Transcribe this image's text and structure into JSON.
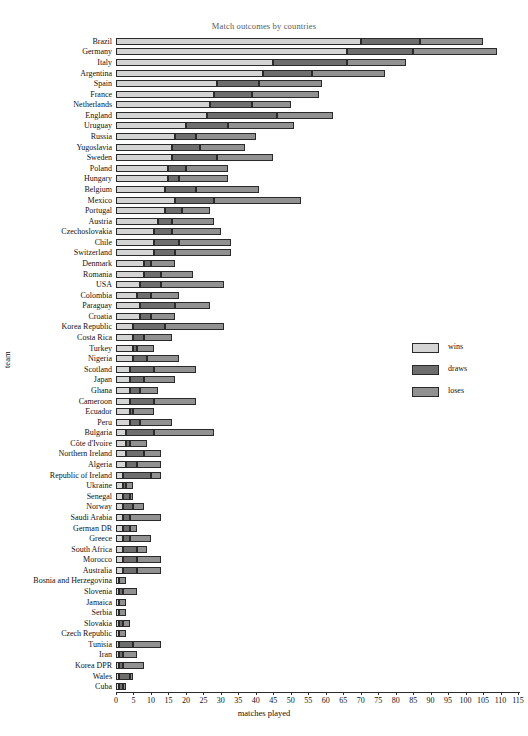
{
  "chart_data": {
    "type": "bar",
    "orientation": "horizontal",
    "stacked": true,
    "title": "Match outcomes by countries",
    "xlabel": "matches played",
    "ylabel": "team",
    "xlim": [
      0,
      115
    ],
    "xticks": [
      0,
      5,
      10,
      15,
      20,
      25,
      30,
      35,
      40,
      45,
      50,
      55,
      60,
      65,
      70,
      75,
      80,
      85,
      90,
      95,
      100,
      105,
      110,
      115
    ],
    "grid": false,
    "legend": {
      "position": "right",
      "entries": [
        {
          "name": "wins",
          "color": "#d4d4d4"
        },
        {
          "name": "draws",
          "color": "#6e6e6e"
        },
        {
          "name": "loses",
          "color": "#919191"
        }
      ]
    },
    "series": [
      {
        "name": "wins",
        "color": "#d4d4d4"
      },
      {
        "name": "draws",
        "color": "#6e6e6e"
      },
      {
        "name": "loses",
        "color": "#919191"
      }
    ],
    "categories": [
      "Brazil",
      "Germany",
      "Italy",
      "Argentina",
      "Spain",
      "France",
      "Netherlands",
      "England",
      "Uruguay",
      "Russia",
      "Yugoslavia",
      "Sweden",
      "Poland",
      "Hungary",
      "Belgium",
      "Mexico",
      "Portugal",
      "Austria",
      "Czechoslovakia",
      "Chile",
      "Switzerland",
      "Denmark",
      "Romania",
      "USA",
      "Colombia",
      "Paraguay",
      "Croatia",
      "Korea Republic",
      "Costa Rica",
      "Turkey",
      "Nigeria",
      "Scotland",
      "Japan",
      "Ghana",
      "Cameroon",
      "Ecuador",
      "Peru",
      "Bulgaria",
      "Côte d'Ivoire",
      "Northern Ireland",
      "Algeria",
      "Republic of Ireland",
      "Ukraine",
      "Senegal",
      "Norway",
      "Saudi Arabia",
      "German DR",
      "Greece",
      "South Africa",
      "Morocco",
      "Australia",
      "Bosnia and Herzegovina",
      "Slovenia",
      "Jamaica",
      "Serbia",
      "Slovakia",
      "Czech Republic",
      "Tunisia",
      "Iran",
      "Korea DPR",
      "Wales",
      "Cuba"
    ],
    "rows": [
      {
        "team": "Brazil",
        "wins": 70,
        "draws": 17,
        "loses": 18
      },
      {
        "team": "Germany",
        "wins": 66,
        "draws": 19,
        "loses": 24
      },
      {
        "team": "Italy",
        "wins": 45,
        "draws": 21,
        "loses": 17
      },
      {
        "team": "Argentina",
        "wins": 42,
        "draws": 14,
        "loses": 21
      },
      {
        "team": "Spain",
        "wins": 29,
        "draws": 12,
        "loses": 18
      },
      {
        "team": "France",
        "wins": 28,
        "draws": 11,
        "loses": 19
      },
      {
        "team": "Netherlands",
        "wins": 27,
        "draws": 12,
        "loses": 11
      },
      {
        "team": "England",
        "wins": 26,
        "draws": 20,
        "loses": 16
      },
      {
        "team": "Uruguay",
        "wins": 20,
        "draws": 12,
        "loses": 19
      },
      {
        "team": "Russia",
        "wins": 17,
        "draws": 6,
        "loses": 17
      },
      {
        "team": "Yugoslavia",
        "wins": 16,
        "draws": 8,
        "loses": 13
      },
      {
        "team": "Sweden",
        "wins": 16,
        "draws": 13,
        "loses": 16
      },
      {
        "team": "Poland",
        "wins": 15,
        "draws": 5,
        "loses": 12
      },
      {
        "team": "Hungary",
        "wins": 15,
        "draws": 3,
        "loses": 14
      },
      {
        "team": "Belgium",
        "wins": 14,
        "draws": 9,
        "loses": 18
      },
      {
        "team": "Mexico",
        "wins": 17,
        "draws": 11,
        "loses": 25
      },
      {
        "team": "Portugal",
        "wins": 14,
        "draws": 5,
        "loses": 8
      },
      {
        "team": "Austria",
        "wins": 12,
        "draws": 4,
        "loses": 12
      },
      {
        "team": "Czechoslovakia",
        "wins": 11,
        "draws": 5,
        "loses": 14
      },
      {
        "team": "Chile",
        "wins": 11,
        "draws": 7,
        "loses": 15
      },
      {
        "team": "Switzerland",
        "wins": 11,
        "draws": 6,
        "loses": 16
      },
      {
        "team": "Denmark",
        "wins": 8,
        "draws": 2,
        "loses": 7
      },
      {
        "team": "Romania",
        "wins": 8,
        "draws": 5,
        "loses": 9
      },
      {
        "team": "USA",
        "wins": 7,
        "draws": 6,
        "loses": 18
      },
      {
        "team": "Colombia",
        "wins": 6,
        "draws": 4,
        "loses": 8
      },
      {
        "team": "Paraguay",
        "wins": 7,
        "draws": 10,
        "loses": 10
      },
      {
        "team": "Croatia",
        "wins": 7,
        "draws": 3,
        "loses": 7
      },
      {
        "team": "Korea Republic",
        "wins": 5,
        "draws": 9,
        "loses": 17
      },
      {
        "team": "Costa Rica",
        "wins": 5,
        "draws": 3,
        "loses": 8
      },
      {
        "team": "Turkey",
        "wins": 5,
        "draws": 1,
        "loses": 5
      },
      {
        "team": "Nigeria",
        "wins": 5,
        "draws": 4,
        "loses": 9
      },
      {
        "team": "Scotland",
        "wins": 4,
        "draws": 7,
        "loses": 12
      },
      {
        "team": "Japan",
        "wins": 4,
        "draws": 4,
        "loses": 9
      },
      {
        "team": "Ghana",
        "wins": 4,
        "draws": 3,
        "loses": 5
      },
      {
        "team": "Cameroon",
        "wins": 4,
        "draws": 7,
        "loses": 12
      },
      {
        "team": "Ecuador",
        "wins": 4,
        "draws": 1,
        "loses": 6
      },
      {
        "team": "Peru",
        "wins": 4,
        "draws": 3,
        "loses": 9
      },
      {
        "team": "Bulgaria",
        "wins": 3,
        "draws": 8,
        "loses": 17
      },
      {
        "team": "Côte d'Ivoire",
        "wins": 3,
        "draws": 1,
        "loses": 5
      },
      {
        "team": "Northern Ireland",
        "wins": 3,
        "draws": 5,
        "loses": 5
      },
      {
        "team": "Algeria",
        "wins": 3,
        "draws": 3,
        "loses": 7
      },
      {
        "team": "Republic of Ireland",
        "wins": 2,
        "draws": 8,
        "loses": 3
      },
      {
        "team": "Ukraine",
        "wins": 2,
        "draws": 1,
        "loses": 2
      },
      {
        "team": "Senegal",
        "wins": 2,
        "draws": 2,
        "loses": 1
      },
      {
        "team": "Norway",
        "wins": 2,
        "draws": 3,
        "loses": 3
      },
      {
        "team": "Saudi Arabia",
        "wins": 2,
        "draws": 2,
        "loses": 9
      },
      {
        "team": "German DR",
        "wins": 2,
        "draws": 2,
        "loses": 2
      },
      {
        "team": "Greece",
        "wins": 2,
        "draws": 2,
        "loses": 6
      },
      {
        "team": "South Africa",
        "wins": 2,
        "draws": 4,
        "loses": 3
      },
      {
        "team": "Morocco",
        "wins": 2,
        "draws": 4,
        "loses": 7
      },
      {
        "team": "Australia",
        "wins": 2,
        "draws": 4,
        "loses": 7
      },
      {
        "team": "Bosnia and Herzegovina",
        "wins": 1,
        "draws": 0,
        "loses": 2
      },
      {
        "team": "Slovenia",
        "wins": 1,
        "draws": 1,
        "loses": 4
      },
      {
        "team": "Jamaica",
        "wins": 1,
        "draws": 0,
        "loses": 2
      },
      {
        "team": "Serbia",
        "wins": 1,
        "draws": 0,
        "loses": 2
      },
      {
        "team": "Slovakia",
        "wins": 1,
        "draws": 1,
        "loses": 2
      },
      {
        "team": "Czech Republic",
        "wins": 1,
        "draws": 0,
        "loses": 2
      },
      {
        "team": "Tunisia",
        "wins": 1,
        "draws": 4,
        "loses": 8
      },
      {
        "team": "Iran",
        "wins": 1,
        "draws": 1,
        "loses": 4
      },
      {
        "team": "Korea DPR",
        "wins": 1,
        "draws": 1,
        "loses": 6
      },
      {
        "team": "Wales",
        "wins": 1,
        "draws": 3,
        "loses": 1
      },
      {
        "team": "Cuba",
        "wins": 1,
        "draws": 1,
        "loses": 1
      }
    ]
  }
}
